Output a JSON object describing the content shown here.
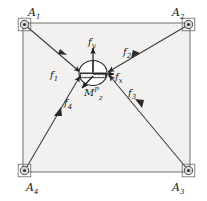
{
  "figure": {
    "background_color": "#ffffff",
    "frame_fill": "#f2f1ef",
    "line_color": "#6b6b6b",
    "cable_color": "#3a3a3a",
    "text_color": "#1a1a1a"
  },
  "frame": {
    "name": "square-frame",
    "left": 23,
    "top": 23,
    "right": 190,
    "bottom": 172
  },
  "anchors": [
    {
      "id": "A1",
      "letter": "A",
      "index": "1",
      "x": 23,
      "y": 23,
      "label_x": 28,
      "label_y": 16,
      "corner": "top-left"
    },
    {
      "id": "A2",
      "letter": "A",
      "index": "2",
      "x": 190,
      "y": 23,
      "label_x": 172,
      "label_y": 16,
      "corner": "top-right"
    },
    {
      "id": "A3",
      "letter": "A",
      "index": "3",
      "x": 190,
      "y": 172,
      "label_x": 172,
      "label_y": 191,
      "corner": "bottom-right"
    },
    {
      "id": "A4",
      "letter": "A",
      "index": "4",
      "x": 23,
      "y": 172,
      "label_x": 26,
      "label_y": 191,
      "corner": "bottom-left"
    }
  ],
  "platform": {
    "name": "end-effector",
    "center_x": 93,
    "center_y": 73,
    "radius_x": 14,
    "radius_y": 12
  },
  "cables": [
    {
      "id": "f1",
      "letter": "f",
      "index": "1",
      "from": "A1",
      "label_x": 50,
      "label_y": 78,
      "arrow_at_x": 62,
      "arrow_at_y": 52
    },
    {
      "id": "f2",
      "letter": "f",
      "index": "2",
      "from": "A2",
      "label_x": 123,
      "label_y": 55,
      "arrow_at_x": 134,
      "arrow_at_y": 55
    },
    {
      "id": "f3",
      "letter": "f",
      "index": "3",
      "from": "A3",
      "label_x": 128,
      "label_y": 95,
      "arrow_at_x": 139,
      "arrow_at_y": 102
    },
    {
      "id": "f4",
      "letter": "f",
      "index": "4",
      "from": "A4",
      "label_x": 64,
      "label_y": 105,
      "arrow_at_x": 57,
      "arrow_at_y": 112
    }
  ],
  "components": [
    {
      "id": "fy",
      "letter": "f",
      "sub": "y",
      "label_x": 89,
      "label_y": 44,
      "direction": "up"
    },
    {
      "id": "fx",
      "letter": "f",
      "sub": "x",
      "label_x": 114,
      "label_y": 78,
      "direction": "right"
    }
  ],
  "moment": {
    "id": "Mz",
    "letter": "M",
    "sub": "z",
    "sup": "P",
    "label_x": 86,
    "label_y": 95,
    "direction": "down-left"
  }
}
